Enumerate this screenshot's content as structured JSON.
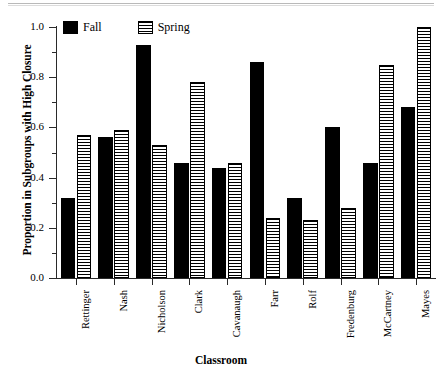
{
  "chart_data": {
    "type": "bar",
    "title": "",
    "xlabel": "Classroom",
    "ylabel": "Proportion in Subgroups with High Closure",
    "ylim": [
      0.0,
      1.0
    ],
    "ytick_labels": [
      "0.0",
      "0.2",
      "0.4",
      "0.6",
      "0.8",
      "1.0"
    ],
    "ytick_values": [
      0.0,
      0.2,
      0.4,
      0.6,
      0.8,
      1.0
    ],
    "yminor_values": [
      0.1,
      0.3,
      0.5,
      0.7,
      0.9
    ],
    "grid": false,
    "legend_position": "upper-left-inside",
    "categories": [
      "Rettinger",
      "Nash",
      "Nicholson",
      "Clark",
      "Cavanaugh",
      "Farr",
      "Rolf",
      "Fredenburg",
      "McCartney",
      "Mayes"
    ],
    "series": [
      {
        "name": "Fall",
        "color": "#000000",
        "fill": "solid-black",
        "values": [
          0.32,
          0.56,
          0.93,
          0.46,
          0.44,
          0.86,
          0.32,
          0.6,
          0.46,
          0.68
        ]
      },
      {
        "name": "Spring",
        "color": "#ffffff",
        "fill": "horizontal-hatch",
        "values": [
          0.57,
          0.59,
          0.53,
          0.78,
          0.46,
          0.24,
          0.23,
          0.28,
          0.85,
          1.0
        ]
      }
    ]
  },
  "legend": {
    "entries": [
      {
        "label": "Fall"
      },
      {
        "label": "Spring"
      }
    ]
  }
}
